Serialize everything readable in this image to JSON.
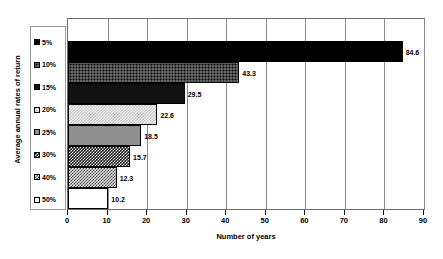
{
  "chart_data": {
    "type": "bar",
    "orientation": "horizontal",
    "title": "",
    "xlabel": "Number of years",
    "ylabel": "Average annual rates of return",
    "xlim": [
      0,
      90
    ],
    "xticks": [
      0,
      10,
      20,
      30,
      40,
      50,
      60,
      70,
      80,
      90
    ],
    "grid": true,
    "legend_position": "left-outside",
    "categories": [
      "5%",
      "10%",
      "15%",
      "20%",
      "25%",
      "30%",
      "40%",
      "50%"
    ],
    "values": [
      84.6,
      43.3,
      29.5,
      22.6,
      18.5,
      15.7,
      12.3,
      10.2
    ],
    "series": [
      {
        "name": "Number of years",
        "points": [
          {
            "category": "5%",
            "value": 84.6,
            "label": "84.6",
            "pattern": "solid-black"
          },
          {
            "category": "10%",
            "value": 43.3,
            "label": "43.3",
            "pattern": "dot-dark"
          },
          {
            "category": "15%",
            "value": 29.5,
            "label": "29.5",
            "pattern": "near-black"
          },
          {
            "category": "20%",
            "value": 22.6,
            "label": "22.6",
            "pattern": "check-light"
          },
          {
            "category": "25%",
            "value": 18.5,
            "label": "18.5",
            "pattern": "gray-solid"
          },
          {
            "category": "30%",
            "value": 15.7,
            "label": "15.7",
            "pattern": "hatch-dark"
          },
          {
            "category": "40%",
            "value": 12.3,
            "label": "12.3",
            "pattern": "hatch-light"
          },
          {
            "category": "50%",
            "value": 10.2,
            "label": "10.2",
            "pattern": "white"
          }
        ]
      }
    ]
  },
  "legend": {
    "items": [
      {
        "label": "5%",
        "pattern": "solid-black"
      },
      {
        "label": "10%",
        "pattern": "dot-dark"
      },
      {
        "label": "15%",
        "pattern": "near-black"
      },
      {
        "label": "20%",
        "pattern": "check-light"
      },
      {
        "label": "25%",
        "pattern": "gray-solid"
      },
      {
        "label": "30%",
        "pattern": "hatch-dark"
      },
      {
        "label": "40%",
        "pattern": "hatch-light"
      },
      {
        "label": "50%",
        "pattern": "white"
      }
    ]
  },
  "axes": {
    "x_title": "Number of years",
    "y_title": "Average annual rates of return",
    "x_tick_labels": [
      "0",
      "10",
      "20",
      "30",
      "40",
      "50",
      "60",
      "70",
      "80",
      "90"
    ]
  },
  "colors": {
    "plot_border": "#6e6e6e",
    "gridline": "#8c8c8c",
    "legend_border": "#9a9a9a",
    "text": "#000000",
    "background": "#ffffff"
  }
}
